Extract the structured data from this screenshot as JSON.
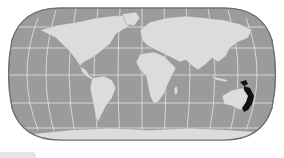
{
  "map": {
    "projection": "robinson",
    "title": "World map with highlighted region in eastern Australia",
    "colors": {
      "background": "#ffffff",
      "ocean": "#9b9b9b",
      "land": "#dcdcdc",
      "graticule": "#e6e6e6",
      "border": "#7a7a7a",
      "highlight": "#111111"
    },
    "highlighted_region": "Eastern Australia",
    "graticule": {
      "parallels_y": [
        27,
        48,
        75,
        103,
        128
      ],
      "meridians_count": 11
    }
  },
  "footer": {
    "bar": ""
  }
}
